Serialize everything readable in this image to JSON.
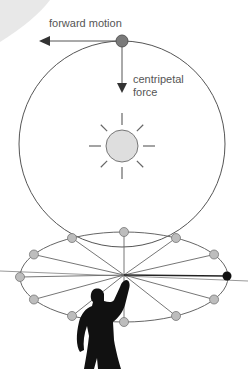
{
  "labels": {
    "forward_motion": "forward motion",
    "centripetal_line1": "centripetal",
    "centripetal_line2": "force"
  },
  "colors": {
    "line": "#555555",
    "orbit_dot": "#bdbdbd",
    "moving_dot": "#7a7a7a",
    "sun_fill": "#dedede",
    "corner_shape": "#e6e6e6",
    "figure": "#111111",
    "end_dot": "#111111"
  },
  "diagram": {
    "orbit_dot_count": 10,
    "sun_ray_count": 8
  }
}
